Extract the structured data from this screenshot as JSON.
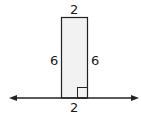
{
  "diagram": {
    "shape": "rectangle",
    "fill": "#f2f2f2",
    "stroke": "#222222",
    "labels": {
      "top": "2",
      "left": "6",
      "right": "6",
      "bottom": "2"
    },
    "right_angle_marker": true,
    "baseline": "number line with arrows both ends"
  }
}
